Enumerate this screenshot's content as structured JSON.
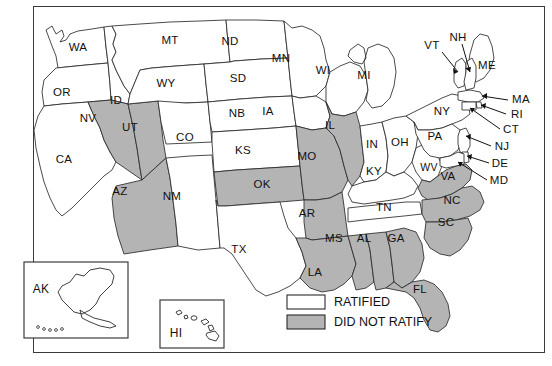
{
  "map": {
    "title": "",
    "colors": {
      "ratified_fill": "#ffffff",
      "did_not_ratify_fill": "#b4b4b4",
      "border": "#2b2b2b",
      "frame": "#3a3a3a",
      "label_text": "#111111"
    },
    "legend": {
      "items": [
        {
          "label": "RATIFIED",
          "fill": "#ffffff"
        },
        {
          "label": "DID NOT RATIFY",
          "fill": "#b4b4b4"
        }
      ]
    },
    "insets": [
      {
        "code": "AK",
        "status": "RATIFIED"
      },
      {
        "code": "HI",
        "status": "RATIFIED"
      }
    ],
    "states": [
      {
        "code": "WA",
        "status": "RATIFIED",
        "labeled": "direct"
      },
      {
        "code": "OR",
        "status": "RATIFIED",
        "labeled": "direct"
      },
      {
        "code": "ID",
        "status": "RATIFIED",
        "labeled": "direct"
      },
      {
        "code": "MT",
        "status": "RATIFIED",
        "labeled": "direct"
      },
      {
        "code": "ND",
        "status": "RATIFIED",
        "labeled": "direct"
      },
      {
        "code": "MN",
        "status": "RATIFIED",
        "labeled": "direct"
      },
      {
        "code": "WI",
        "status": "RATIFIED",
        "labeled": "direct"
      },
      {
        "code": "MI",
        "status": "RATIFIED",
        "labeled": "direct"
      },
      {
        "code": "SD",
        "status": "RATIFIED",
        "labeled": "direct"
      },
      {
        "code": "WY",
        "status": "RATIFIED",
        "labeled": "direct"
      },
      {
        "code": "NV",
        "status": "DID NOT RATIFY",
        "labeled": "direct"
      },
      {
        "code": "UT",
        "status": "DID NOT RATIFY",
        "labeled": "direct"
      },
      {
        "code": "CO",
        "status": "RATIFIED",
        "labeled": "direct"
      },
      {
        "code": "NB",
        "status": "RATIFIED",
        "labeled": "direct"
      },
      {
        "code": "IA",
        "status": "RATIFIED",
        "labeled": "direct"
      },
      {
        "code": "IL",
        "status": "DID NOT RATIFY",
        "labeled": "direct"
      },
      {
        "code": "IN",
        "status": "RATIFIED",
        "labeled": "direct"
      },
      {
        "code": "OH",
        "status": "RATIFIED",
        "labeled": "direct"
      },
      {
        "code": "CA",
        "status": "RATIFIED",
        "labeled": "direct"
      },
      {
        "code": "AZ",
        "status": "DID NOT RATIFY",
        "labeled": "direct"
      },
      {
        "code": "NM",
        "status": "RATIFIED",
        "labeled": "direct"
      },
      {
        "code": "KS",
        "status": "RATIFIED",
        "labeled": "direct"
      },
      {
        "code": "MO",
        "status": "DID NOT RATIFY",
        "labeled": "direct"
      },
      {
        "code": "KY",
        "status": "RATIFIED",
        "labeled": "direct"
      },
      {
        "code": "WV",
        "status": "RATIFIED",
        "labeled": "direct"
      },
      {
        "code": "VA",
        "status": "DID NOT RATIFY",
        "labeled": "direct"
      },
      {
        "code": "OK",
        "status": "DID NOT RATIFY",
        "labeled": "direct"
      },
      {
        "code": "AR",
        "status": "DID NOT RATIFY",
        "labeled": "direct"
      },
      {
        "code": "TN",
        "status": "RATIFIED",
        "labeled": "direct"
      },
      {
        "code": "NC",
        "status": "DID NOT RATIFY",
        "labeled": "direct"
      },
      {
        "code": "SC",
        "status": "DID NOT RATIFY",
        "labeled": "direct"
      },
      {
        "code": "TX",
        "status": "RATIFIED",
        "labeled": "direct"
      },
      {
        "code": "MS",
        "status": "DID NOT RATIFY",
        "labeled": "direct"
      },
      {
        "code": "AL",
        "status": "DID NOT RATIFY",
        "labeled": "direct"
      },
      {
        "code": "GA",
        "status": "DID NOT RATIFY",
        "labeled": "direct"
      },
      {
        "code": "LA",
        "status": "DID NOT RATIFY",
        "labeled": "direct"
      },
      {
        "code": "FL",
        "status": "DID NOT RATIFY",
        "labeled": "direct"
      },
      {
        "code": "PA",
        "status": "RATIFIED",
        "labeled": "direct"
      },
      {
        "code": "NY",
        "status": "RATIFIED",
        "labeled": "direct"
      },
      {
        "code": "ME",
        "status": "RATIFIED",
        "labeled": "direct"
      },
      {
        "code": "VT",
        "status": "RATIFIED",
        "labeled": "leader"
      },
      {
        "code": "NH",
        "status": "RATIFIED",
        "labeled": "leader"
      },
      {
        "code": "MA",
        "status": "RATIFIED",
        "labeled": "leader"
      },
      {
        "code": "RI",
        "status": "RATIFIED",
        "labeled": "leader"
      },
      {
        "code": "CT",
        "status": "RATIFIED",
        "labeled": "leader"
      },
      {
        "code": "NJ",
        "status": "RATIFIED",
        "labeled": "leader"
      },
      {
        "code": "DE",
        "status": "RATIFIED",
        "labeled": "leader"
      },
      {
        "code": "MD",
        "status": "RATIFIED",
        "labeled": "leader"
      }
    ],
    "labels": {
      "WA": "WA",
      "OR": "OR",
      "ID": "ID",
      "MT": "MT",
      "ND": "ND",
      "MN": "MN",
      "WI": "WI",
      "MI": "MI",
      "SD": "SD",
      "WY": "WY",
      "NV": "NV",
      "UT": "UT",
      "CO": "CO",
      "NB": "NB",
      "IA": "IA",
      "IL": "IL",
      "IN": "IN",
      "OH": "OH",
      "CA": "CA",
      "AZ": "AZ",
      "NM": "NM",
      "KS": "KS",
      "MO": "MO",
      "KY": "KY",
      "WV": "WV",
      "VA": "VA",
      "OK": "OK",
      "AR": "AR",
      "TN": "TN",
      "NC": "NC",
      "SC": "SC",
      "TX": "TX",
      "MS": "MS",
      "AL": "AL",
      "GA": "GA",
      "LA": "LA",
      "FL": "FL",
      "PA": "PA",
      "NY": "NY",
      "ME": "ME",
      "VT": "VT",
      "NH": "NH",
      "MA": "MA",
      "RI": "RI",
      "CT": "CT",
      "NJ": "NJ",
      "DE": "DE",
      "MD": "MD",
      "AK": "AK",
      "HI": "HI"
    }
  }
}
